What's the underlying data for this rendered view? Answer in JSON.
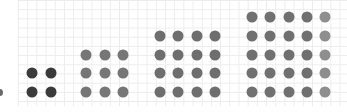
{
  "diagram": {
    "grid_color": "#ececec",
    "groups": [
      {
        "name": "2x2",
        "size": 2,
        "count": 4,
        "color": "#3a3a3a",
        "xs": [
          32,
          51
        ],
        "ys": [
          73,
          92
        ]
      },
      {
        "name": "3x3",
        "size": 3,
        "count": 9,
        "color": "#767676",
        "xs": [
          86,
          105,
          123
        ],
        "ys": [
          55,
          73,
          92
        ]
      },
      {
        "name": "4x4",
        "size": 4,
        "count": 16,
        "color": "#6e6e6e",
        "xs": [
          160,
          178,
          197,
          215
        ],
        "ys": [
          36,
          55,
          73,
          92
        ]
      },
      {
        "name": "5x5",
        "size": 5,
        "count": 25,
        "color": "#707070",
        "last_column_color": "#8e8e8e",
        "xs": [
          252,
          270,
          289,
          307,
          325
        ],
        "ys": [
          17,
          36,
          55,
          73,
          92
        ]
      }
    ]
  }
}
